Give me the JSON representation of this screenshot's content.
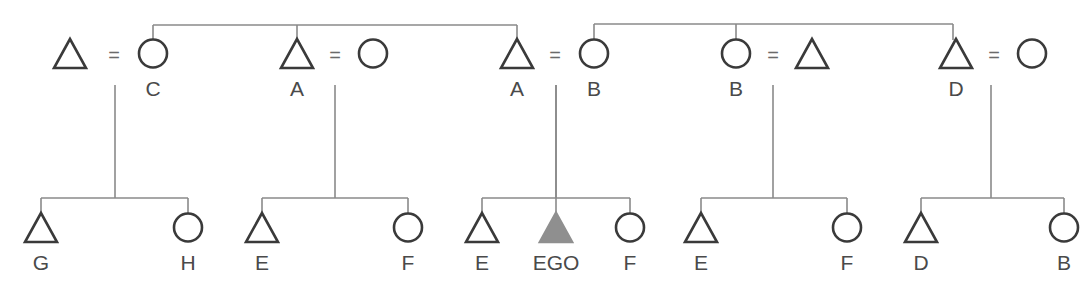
{
  "diagram": {
    "type": "kinship-chart",
    "ego_color": "#8f8f8f",
    "line_color": "#8a8a8a",
    "symbol_color": "#3a3a3a",
    "marriage_symbol": "=",
    "top_row": [
      {
        "id": "m1",
        "sex": "male",
        "label": "",
        "x": 70
      },
      {
        "id": "f1",
        "sex": "female",
        "label": "C",
        "x": 153
      },
      {
        "id": "m2",
        "sex": "male",
        "label": "A",
        "x": 297
      },
      {
        "id": "f2",
        "sex": "female",
        "label": "",
        "x": 373
      },
      {
        "id": "m3",
        "sex": "male",
        "label": "A",
        "x": 517
      },
      {
        "id": "f3",
        "sex": "female",
        "label": "B",
        "x": 594
      },
      {
        "id": "f4",
        "sex": "female",
        "label": "B",
        "x": 736
      },
      {
        "id": "m4",
        "sex": "male",
        "label": "",
        "x": 812
      },
      {
        "id": "m5",
        "sex": "male",
        "label": "D",
        "x": 956
      },
      {
        "id": "f5",
        "sex": "female",
        "label": "",
        "x": 1032
      }
    ],
    "marriages": [
      {
        "a": "m1",
        "b": "f1",
        "eq_x": 114,
        "drop_x": 115
      },
      {
        "a": "m2",
        "b": "f2",
        "eq_x": 335,
        "drop_x": 335
      },
      {
        "a": "m3",
        "b": "f3",
        "eq_x": 555,
        "drop_x": 556
      },
      {
        "a": "f4",
        "b": "m4",
        "eq_x": 773,
        "drop_x": 773
      },
      {
        "a": "m5",
        "b": "f5",
        "eq_x": 994,
        "drop_x": 991
      }
    ],
    "sibling_groups_top": [
      {
        "members_x": [
          153,
          297,
          517
        ],
        "bar_y": 25
      },
      {
        "members_x": [
          594,
          736,
          953
        ],
        "bar_y": 24
      }
    ],
    "bottom_row": [
      {
        "id": "c1",
        "sex": "male",
        "label": "G",
        "x": 41,
        "family": 0
      },
      {
        "id": "c2",
        "sex": "female",
        "label": "H",
        "x": 188,
        "family": 0
      },
      {
        "id": "c3",
        "sex": "male",
        "label": "E",
        "x": 262,
        "family": 1
      },
      {
        "id": "c4",
        "sex": "female",
        "label": "F",
        "x": 408,
        "family": 1
      },
      {
        "id": "c5",
        "sex": "male",
        "label": "E",
        "x": 482,
        "family": 2
      },
      {
        "id": "c6",
        "sex": "male",
        "label": "EGO",
        "x": 556,
        "family": 2,
        "ego": true
      },
      {
        "id": "c7",
        "sex": "female",
        "label": "F",
        "x": 630,
        "family": 2
      },
      {
        "id": "c8",
        "sex": "male",
        "label": "E",
        "x": 701,
        "family": 3
      },
      {
        "id": "c9",
        "sex": "female",
        "label": "F",
        "x": 847,
        "family": 3
      },
      {
        "id": "c10",
        "sex": "male",
        "label": "D",
        "x": 921,
        "family": 4
      },
      {
        "id": "c11",
        "sex": "female",
        "label": "B",
        "x": 1064,
        "family": 4
      }
    ]
  }
}
